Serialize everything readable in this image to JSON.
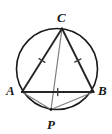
{
  "figure": {
    "kind": "geometry-diagram",
    "width": 112,
    "height": 134,
    "background": "#ffffff"
  },
  "colors": {
    "circle_stroke": "#1a1a1a",
    "triangle_stroke": "#262626",
    "chord_stroke": "#7d7d85",
    "tick_stroke": "#3a3a3a",
    "label_color": "#1a1a1a"
  },
  "circle": {
    "name": "circumcircle",
    "cx": 57,
    "cy": 69,
    "r": 40.5,
    "stroke_width": 1.6
  },
  "points": [
    {
      "id": "C",
      "label": "C",
      "x": 62,
      "y": 28.5,
      "label_x": 57,
      "label_y": 11
    },
    {
      "id": "A",
      "label": "A",
      "x": 22,
      "y": 92,
      "label_x": 6,
      "label_y": 84
    },
    {
      "id": "B",
      "label": "B",
      "x": 93.5,
      "y": 92,
      "label_x": 98,
      "label_y": 84
    },
    {
      "id": "P",
      "label": "P",
      "x": 51,
      "y": 109.5,
      "label_x": 47,
      "label_y": 118
    }
  ],
  "triangle": {
    "name": "triangle-ABC",
    "vertices": [
      "A",
      "C",
      "B"
    ],
    "polygon_points": "22,92 62,28.5 93.5,92",
    "stroke_width": 1.9,
    "fill": "none"
  },
  "sides": [
    {
      "id": "AC",
      "from": "A",
      "to": "C",
      "x1": 22,
      "y1": 92,
      "x2": 62,
      "y2": 28.5,
      "ticks": 1
    },
    {
      "id": "CB",
      "from": "C",
      "to": "B",
      "x1": 62,
      "y1": 28.5,
      "x2": 93.5,
      "y2": 92,
      "ticks": 1
    },
    {
      "id": "AB",
      "from": "A",
      "to": "B",
      "x1": 22,
      "y1": 92,
      "x2": 93.5,
      "y2": 92,
      "ticks": 1
    }
  ],
  "tick_marks": [
    {
      "id": "tick-AC",
      "on": "AC",
      "cx": 42,
      "cy": 60.5,
      "angle": -57.8,
      "length": 7
    },
    {
      "id": "tick-CB",
      "on": "CB",
      "cx": 77.8,
      "cy": 60.5,
      "angle": 63.6,
      "length": 7
    },
    {
      "id": "tick-AB",
      "on": "AB",
      "cx": 57.7,
      "cy": 92,
      "angle": 0,
      "length": 7
    }
  ],
  "chords": [
    {
      "id": "CP",
      "from": "C",
      "to": "P",
      "x1": 62,
      "y1": 28.5,
      "x2": 51,
      "y2": 109.5,
      "stroke_width": 1.2
    },
    {
      "id": "PA",
      "from": "P",
      "to": "A",
      "x1": 51,
      "y1": 109.5,
      "x2": 22,
      "y2": 92,
      "stroke_width": 1.2
    },
    {
      "id": "PB",
      "from": "P",
      "to": "B",
      "x1": 51,
      "y1": 109.5,
      "x2": 93.5,
      "y2": 92,
      "stroke_width": 1.2
    }
  ]
}
